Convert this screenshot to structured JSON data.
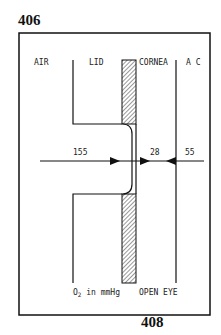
{
  "page_top": "406",
  "page_bottom": "408",
  "diagram": {
    "regions": [
      "AIR",
      "LID",
      "CORNEA",
      "A C"
    ],
    "values": {
      "air_lid": "155",
      "cornea": "28",
      "ac": "55"
    },
    "units_label_prefix": "O",
    "units_label_sub": "2",
    "units_label_suffix": " in mmHg",
    "condition": "OPEN EYE"
  }
}
